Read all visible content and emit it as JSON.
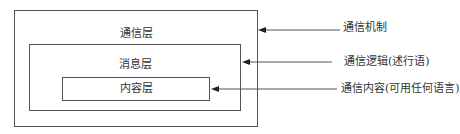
{
  "diagram": {
    "layers": [
      {
        "id": "communication",
        "label": "通信层"
      },
      {
        "id": "message",
        "label": "消息层"
      },
      {
        "id": "content",
        "label": "内容层"
      }
    ],
    "annotations": [
      {
        "target": "communication",
        "label": "通信机制"
      },
      {
        "target": "message",
        "label": "通信逻辑(述行语)"
      },
      {
        "target": "content",
        "label": "通信内容(可用任何语言)"
      }
    ],
    "colors": {
      "line": "#555555",
      "text": "#333333",
      "background": "#ffffff"
    }
  }
}
